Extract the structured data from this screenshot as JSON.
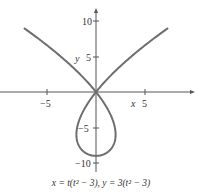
{
  "chart_data": {
    "type": "line",
    "title": "",
    "caption": "x = t(t² − 3), y = 3(t² − 3)",
    "xlabel": "x",
    "ylabel": "y",
    "xlim": [
      -9.6,
      9.6
    ],
    "ylim": [
      -10.5,
      11.5
    ],
    "x_ticks": [
      -5,
      5
    ],
    "y_ticks": [
      10,
      5,
      -5,
      -10
    ],
    "grid": false,
    "series": [
      {
        "name": "parametric curve",
        "color": "#6e6e6e",
        "t_range": [
          -2.45,
          2.45
        ],
        "x": [
          -9.37,
          -6.0,
          -2.0,
          0,
          2.0,
          2.0,
          0,
          -2.0,
          -2.0,
          0,
          2.0,
          6.0,
          9.37
        ],
        "y": [
          9.0,
          5.5,
          1.5,
          0,
          -3.0,
          -6.0,
          -9.0,
          -6.0,
          -3.0,
          0,
          1.5,
          5.5,
          9.0
        ]
      }
    ]
  },
  "labels": {
    "x_axis": "x",
    "y_axis": "y",
    "tick_neg5_x": "−5",
    "tick_5_x": "5",
    "tick_10_y": "10",
    "tick_5_y": "5",
    "tick_neg5_y": "−5",
    "tick_neg10_y": "−10"
  },
  "caption": "x = t(t² − 3), y = 3(t² − 3)"
}
